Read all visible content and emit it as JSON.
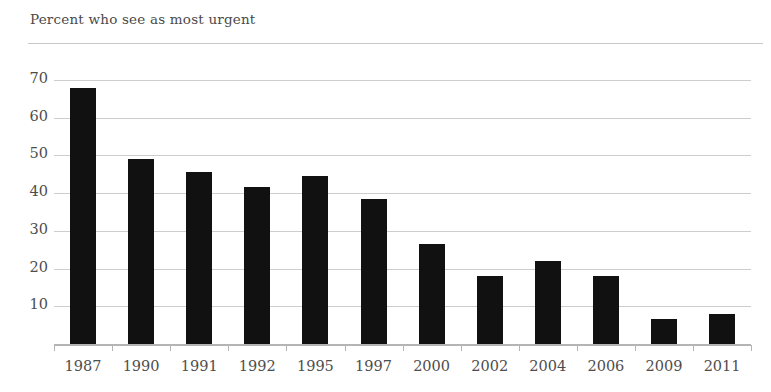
{
  "chart_data": {
    "type": "bar",
    "title": "Percent who see as most urgent",
    "xlabel": "",
    "ylabel": "",
    "categories": [
      "1987",
      "1990",
      "1991",
      "1992",
      "1995",
      "1997",
      "2000",
      "2002",
      "2004",
      "2006",
      "2009",
      "2011"
    ],
    "values": [
      68,
      49,
      45.5,
      41.5,
      44.5,
      38.5,
      26.5,
      18,
      22,
      18,
      6.5,
      8
    ],
    "ylim": [
      0,
      74
    ],
    "yticks": [
      10,
      20,
      30,
      40,
      50,
      60,
      70
    ],
    "ytick_labels": [
      "10",
      "20",
      "30",
      "40",
      "50",
      "60",
      "70"
    ],
    "grid": true,
    "legend": false,
    "bar_color": "#111111",
    "grid_color": "#cdcdcd",
    "axis_color": "#b4b4b4",
    "text_color": "#4d4d4d"
  }
}
